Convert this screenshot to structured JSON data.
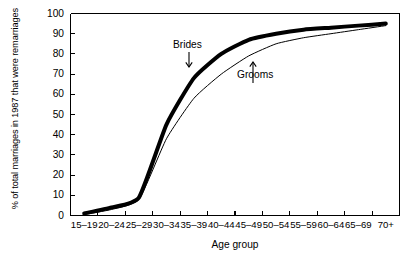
{
  "chart_data": {
    "type": "line",
    "title": "",
    "xlabel": "Age group",
    "ylabel": "% of total marriages in 1987 that were remarriages",
    "categories": [
      "15–19",
      "20–24",
      "25–29",
      "30–34",
      "35–39",
      "40–44",
      "45–49",
      "50–54",
      "55–59",
      "60–64",
      "65–69",
      "70+"
    ],
    "ylim": [
      0,
      100
    ],
    "yticks": [
      0,
      10,
      20,
      30,
      40,
      50,
      60,
      70,
      80,
      90,
      100
    ],
    "ytick_labels": [
      "0",
      "10",
      "20",
      "30",
      "40",
      "50",
      "60",
      "70",
      "80",
      "90",
      "100"
    ],
    "grid": false,
    "legend_position": "inline-annotations",
    "series": [
      {
        "name": "Brides",
        "color": "#000000",
        "line_width": 4,
        "values": [
          1,
          4,
          9,
          45,
          68,
          80,
          87,
          90,
          92,
          93,
          94,
          95
        ]
      },
      {
        "name": "Grooms",
        "color": "#000000",
        "line_width": 1,
        "values": [
          0.5,
          3,
          8,
          38,
          58,
          70,
          79,
          85,
          88,
          90,
          92,
          94
        ]
      }
    ],
    "annotations": [
      {
        "text": "Brides",
        "arrow": "down",
        "target_series": "Brides"
      },
      {
        "text": "Grooms",
        "arrow": "up",
        "target_series": "Grooms"
      }
    ]
  }
}
